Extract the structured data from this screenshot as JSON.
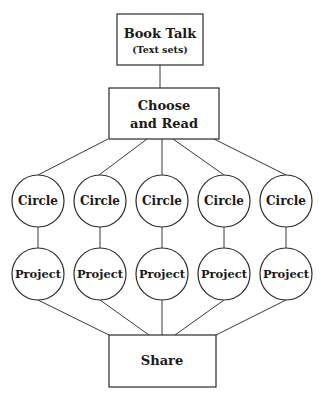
{
  "diagram": {
    "type": "flowchart",
    "nodes": {
      "book_talk": {
        "title": "Book Talk",
        "subtitle": "(Text sets)",
        "shape": "rectangle"
      },
      "choose": {
        "line1": "Choose",
        "line2": "and Read",
        "shape": "rectangle"
      },
      "circles": [
        {
          "label": "Circle",
          "shape": "circle"
        },
        {
          "label": "Circle",
          "shape": "circle"
        },
        {
          "label": "Circle",
          "shape": "circle"
        },
        {
          "label": "Circle",
          "shape": "circle"
        },
        {
          "label": "Circle",
          "shape": "circle"
        }
      ],
      "projects": [
        {
          "label": "Project",
          "shape": "circle"
        },
        {
          "label": "Project",
          "shape": "circle"
        },
        {
          "label": "Project",
          "shape": "circle"
        },
        {
          "label": "Project",
          "shape": "circle"
        },
        {
          "label": "Project",
          "shape": "circle"
        }
      ],
      "share": {
        "label": "Share",
        "shape": "rectangle"
      }
    },
    "edges": [
      [
        "Book Talk",
        "Choose and Read"
      ],
      [
        "Choose and Read",
        "Circle 1"
      ],
      [
        "Choose and Read",
        "Circle 2"
      ],
      [
        "Choose and Read",
        "Circle 3"
      ],
      [
        "Choose and Read",
        "Circle 4"
      ],
      [
        "Choose and Read",
        "Circle 5"
      ],
      [
        "Circle 1",
        "Project 1"
      ],
      [
        "Circle 2",
        "Project 2"
      ],
      [
        "Circle 3",
        "Project 3"
      ],
      [
        "Circle 4",
        "Project 4"
      ],
      [
        "Circle 5",
        "Project 5"
      ],
      [
        "Project 1",
        "Share"
      ],
      [
        "Project 2",
        "Share"
      ],
      [
        "Project 3",
        "Share"
      ],
      [
        "Project 4",
        "Share"
      ],
      [
        "Project 5",
        "Share"
      ]
    ]
  }
}
